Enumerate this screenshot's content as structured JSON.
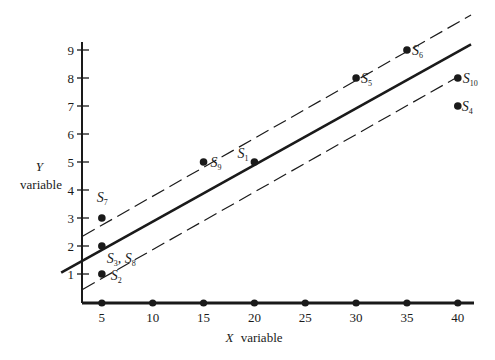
{
  "chart_data": {
    "type": "scatter",
    "title": "",
    "xlabel": "X variable",
    "xlabel_italic_part": "X",
    "xlabel_rest": "variable",
    "ylabel": "Y variable",
    "ylabel_italic_part": "Y",
    "ylabel_rest": "variable",
    "xlim": [
      3,
      41
    ],
    "ylim": [
      0,
      9.5
    ],
    "x_ticks": [
      5,
      10,
      15,
      20,
      25,
      30,
      35,
      40
    ],
    "y_ticks": [
      1,
      2,
      3,
      4,
      5,
      6,
      7,
      8,
      9
    ],
    "grid": false,
    "legend": null,
    "points": [
      {
        "label": "S",
        "sub": "1",
        "x": 20,
        "y": 5
      },
      {
        "label": "S",
        "sub": "2",
        "x": 5,
        "y": 1
      },
      {
        "label": "S",
        "sub": "3",
        "x": 5,
        "y": 2
      },
      {
        "label": "S",
        "sub": "4",
        "x": 40,
        "y": 7
      },
      {
        "label": "S",
        "sub": "5",
        "x": 30,
        "y": 8
      },
      {
        "label": "S",
        "sub": "6",
        "x": 35,
        "y": 9
      },
      {
        "label": "S",
        "sub": "7",
        "x": 5,
        "y": 3
      },
      {
        "label": "S",
        "sub": "8",
        "x": 5,
        "y": 2
      },
      {
        "label": "S",
        "sub": "9",
        "x": 15,
        "y": 5
      },
      {
        "label": "S",
        "sub": "10",
        "x": 40,
        "y": 8
      }
    ],
    "x_axis_points": [
      5,
      10,
      15,
      20,
      25,
      30,
      35,
      40
    ],
    "regression_line": {
      "style": "solid",
      "x_start": 1,
      "y_start": 1.05,
      "x_end": 41.3,
      "y_end": 9.2
    },
    "confidence_bands": [
      {
        "name": "upper",
        "style": "dashed",
        "x_start": 3.1,
        "y_start": 2.35,
        "x_end": 41.3,
        "y_end": 10.25
      },
      {
        "name": "lower",
        "style": "dashed",
        "x_start": 3.1,
        "y_start": 0.45,
        "x_end": 39.8,
        "y_end": 8.0
      }
    ],
    "annotations": [
      "S3, S8"
    ]
  }
}
